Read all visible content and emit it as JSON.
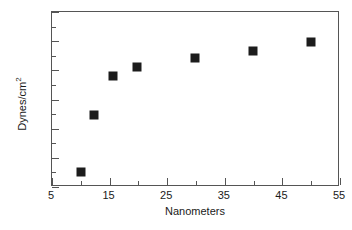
{
  "chart_data": {
    "type": "scatter",
    "title": "",
    "subtitle": "",
    "xlabel": "Nanometers",
    "ylabel": "Dynes/cm",
    "ylabel_superscript": "2",
    "xlim": [
      5,
      55
    ],
    "ylim": [
      6000,
      7200
    ],
    "x_major_ticks": [
      5,
      15,
      25,
      35,
      45,
      55
    ],
    "x_minor_ticks": [
      10,
      20,
      30,
      40,
      50
    ],
    "y_major_ticks": [
      6000,
      6200,
      6400,
      6600,
      6800,
      7000,
      7200
    ],
    "y_minor_ticks": [
      6100,
      6300,
      6500,
      6700,
      6900,
      7100
    ],
    "x_tick_labels": [
      "5",
      "15",
      "25",
      "35",
      "45",
      "55"
    ],
    "y_tick_labels": [
      "6000",
      "6200",
      "6400",
      "6600",
      "6800",
      "7000",
      "7200"
    ],
    "grid": false,
    "legend": false,
    "legend_position": "none",
    "marker_shape": "square",
    "marker_color": "#1c1c1c",
    "axis_color": "#555555",
    "background_color": "#ffffff",
    "series": [
      {
        "name": "surface tension",
        "x": [
          10,
          12.3,
          15.6,
          19.8,
          29.8,
          39.9,
          49.9
        ],
        "y": [
          6105,
          6495,
          6760,
          6825,
          6885,
          6930,
          6995
        ]
      }
    ]
  }
}
